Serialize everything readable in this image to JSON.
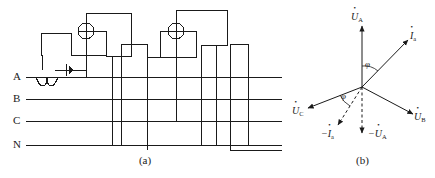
{
  "figure": {
    "type": "three-phase-metering-wiring-and-phasor-diagram",
    "captions": {
      "a": "(a)",
      "b": "(b)"
    }
  },
  "circuit": {
    "phase_labels": [
      "A",
      "B",
      "C",
      "N"
    ],
    "components": [
      {
        "name": "coil-symbol",
        "line": "A"
      },
      {
        "name": "ct-marker-symbol",
        "line": "A"
      },
      {
        "name": "meter-element-1",
        "glyph": "crossed-circle"
      },
      {
        "name": "meter-element-2",
        "glyph": "crossed-circle"
      }
    ],
    "bus_lines": [
      {
        "label": "A",
        "y": 77
      },
      {
        "label": "B",
        "y": 99
      },
      {
        "label": "C",
        "y": 121
      },
      {
        "label": "N",
        "y": 145
      }
    ]
  },
  "phasor": {
    "vectors": [
      {
        "name": "U-A",
        "label": "U",
        "sub": "A",
        "prefix": "",
        "angle_deg": 90,
        "style": "solid"
      },
      {
        "name": "I-a",
        "label": "I",
        "sub": "a",
        "prefix": "",
        "angle_deg": 55,
        "style": "solid"
      },
      {
        "name": "U-B",
        "label": "U",
        "sub": "B",
        "prefix": "",
        "angle_deg": -30,
        "style": "solid"
      },
      {
        "name": "U-C",
        "label": "U",
        "sub": "C",
        "prefix": "",
        "angle_deg": 205,
        "style": "solid"
      },
      {
        "name": "neg-I-a",
        "label": "I",
        "sub": "a",
        "prefix": "−",
        "angle_deg": 235,
        "style": "dashed"
      },
      {
        "name": "neg-U-A",
        "label": "U",
        "sub": "A",
        "prefix": "−",
        "angle_deg": 270,
        "style": "dashed"
      }
    ],
    "angles": [
      {
        "name": "phi-upper",
        "label": "φ"
      },
      {
        "name": "phi-lower",
        "label": "φ"
      }
    ],
    "labels": {
      "u_a": "U",
      "u_a_sub": "A",
      "i_a": "I",
      "i_a_sub": "a",
      "u_b": "U",
      "u_b_sub": "B",
      "u_c": "U",
      "u_c_sub": "C",
      "neg_i_a_prefix": "−",
      "neg_u_a_prefix": "−",
      "phi": "φ"
    }
  },
  "colors": {
    "line": "#1a1a1a",
    "background": "#ffffff",
    "text": "#1a1a1a"
  }
}
